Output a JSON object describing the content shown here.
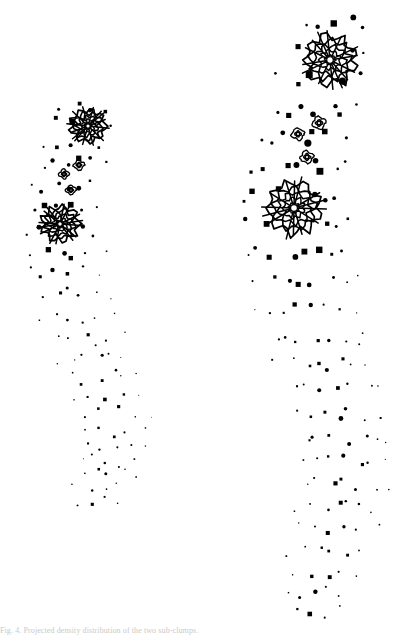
{
  "figure": {
    "background_color": "#ffffff",
    "ink_color": "#000000",
    "width": 405,
    "height": 636,
    "caption": "Fig. 4. Projected density distribution of the two sub-clumps.",
    "panel_count": 2
  },
  "chart_data": {
    "type": "scatter",
    "title": "",
    "subtitle": "",
    "xlabel": "",
    "ylabel": "",
    "xlim": [
      0,
      405
    ],
    "ylim": [
      0,
      636
    ],
    "grid": false,
    "legend": null,
    "axes_visible": false,
    "tick_labels": [],
    "annotations": [],
    "panels": [
      {
        "name": "left-panel",
        "label": "",
        "scale": 1.0,
        "point_count": 236,
        "dot_size_range": [
          0.6,
          2.4
        ],
        "band": {
          "description": "S-shaped curved band of points",
          "spine": [
            [
              88,
              96
            ],
            [
              80,
              120
            ],
            [
              70,
              148
            ],
            [
              62,
              178
            ],
            [
              58,
              208
            ],
            [
              58,
              238
            ],
            [
              62,
              268
            ],
            [
              70,
              298
            ],
            [
              80,
              328
            ],
            [
              90,
              356
            ],
            [
              100,
              382
            ],
            [
              108,
              406
            ],
            [
              112,
              430
            ],
            [
              110,
              452
            ],
            [
              104,
              472
            ],
            [
              96,
              490
            ],
            [
              88,
              503
            ]
          ],
          "half_width": [
            22,
            26,
            30,
            33,
            35,
            36,
            36,
            35,
            34,
            33,
            32,
            31,
            30,
            28,
            26,
            22,
            16
          ]
        },
        "peaks": [
          {
            "name": "primary-peak-upper",
            "cx": 88,
            "cy": 126,
            "rings": 5,
            "r_max": 17,
            "kind": "major"
          },
          {
            "name": "primary-peak-lower",
            "cx": 60,
            "cy": 224,
            "rings": 5,
            "r_max": 18,
            "kind": "major"
          },
          {
            "name": "minor-peak-a",
            "cx": 79,
            "cy": 165,
            "rings": 2,
            "r_max": 5.0,
            "kind": "minor"
          },
          {
            "name": "minor-peak-b",
            "cx": 64,
            "cy": 174,
            "rings": 2,
            "r_max": 4.6,
            "kind": "minor"
          },
          {
            "name": "minor-peak-c",
            "cx": 71,
            "cy": 190,
            "rings": 2,
            "r_max": 4.6,
            "kind": "minor"
          }
        ]
      },
      {
        "name": "right-panel",
        "label": "",
        "scale": 1.4,
        "point_count": 268,
        "dot_size_range": [
          0.7,
          3.0
        ],
        "band": {
          "description": "S-shaped curved band of points, larger scale",
          "spine": [
            [
              340,
              10
            ],
            [
              330,
              44
            ],
            [
              318,
              80
            ],
            [
              306,
              118
            ],
            [
              298,
              154
            ],
            [
              293,
              190
            ],
            [
              292,
              226
            ],
            [
              296,
              262
            ],
            [
              304,
              298
            ],
            [
              314,
              334
            ],
            [
              325,
              368
            ],
            [
              334,
              400
            ],
            [
              340,
              430
            ],
            [
              342,
              460
            ],
            [
              340,
              488
            ],
            [
              334,
              516
            ],
            [
              326,
              545
            ],
            [
              318,
              572
            ],
            [
              312,
              598
            ],
            [
              308,
              622
            ]
          ],
          "half_width": [
            26,
            32,
            38,
            43,
            46,
            48,
            49,
            49,
            48,
            47,
            46,
            45,
            44,
            43,
            41,
            38,
            34,
            30,
            25,
            18
          ]
        },
        "peaks": [
          {
            "name": "primary-peak-upper",
            "cx": 330,
            "cy": 60,
            "rings": 5,
            "r_max": 25,
            "kind": "major"
          },
          {
            "name": "primary-peak-lower",
            "cx": 294,
            "cy": 208,
            "rings": 5,
            "r_max": 26,
            "kind": "major"
          },
          {
            "name": "minor-peak-a",
            "cx": 319,
            "cy": 123,
            "rings": 2,
            "r_max": 6.4,
            "kind": "minor"
          },
          {
            "name": "minor-peak-b",
            "cx": 298,
            "cy": 134,
            "rings": 2,
            "r_max": 6.0,
            "kind": "minor"
          },
          {
            "name": "minor-peak-c",
            "cx": 307,
            "cy": 157,
            "rings": 2,
            "r_max": 6.2,
            "kind": "minor"
          }
        ]
      }
    ]
  }
}
